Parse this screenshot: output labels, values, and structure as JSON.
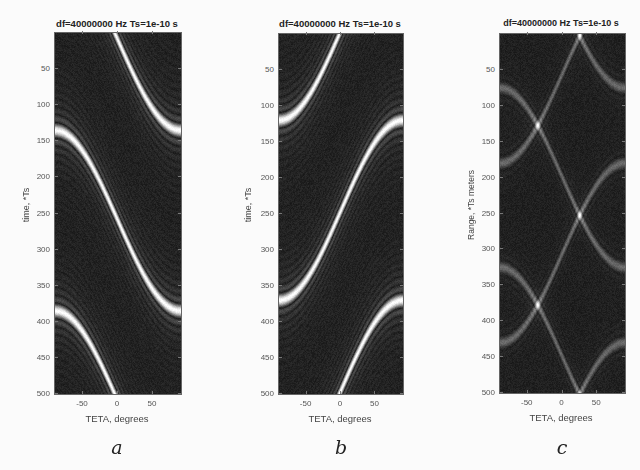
{
  "figure": {
    "panels": [
      {
        "id": "a",
        "caption": "a",
        "title": "df=40000000  Hz Ts=1e-10 s",
        "xlabel": "TETA, degrees",
        "ylabel": "time, *Ts",
        "xticks": [
          "-50",
          "0",
          "50"
        ],
        "yticks": [
          "50",
          "100",
          "150",
          "200",
          "250",
          "300",
          "350",
          "400",
          "450",
          "500"
        ]
      },
      {
        "id": "b",
        "caption": "b",
        "title": "df=40000000  Hz Ts=1e-10 s",
        "xlabel": "TETA, degrees",
        "ylabel": "time, *Ts",
        "xticks": [
          "-50",
          "0",
          "50"
        ],
        "yticks": [
          "50",
          "100",
          "150",
          "200",
          "250",
          "300",
          "350",
          "400",
          "450",
          "500"
        ]
      },
      {
        "id": "c",
        "caption": "c",
        "title": "df=40000000  Hz Ts=1e-10 s",
        "xlabel": "TETA, degrees",
        "ylabel": "Range, *Ts meters",
        "xticks": [
          "-50",
          "0",
          "50"
        ],
        "yticks": [
          "50",
          "100",
          "150",
          "200",
          "250",
          "300",
          "350",
          "400",
          "450",
          "500"
        ]
      }
    ]
  },
  "chart_data": [
    {
      "type": "heatmap",
      "panel": "a",
      "title": "df=40000000  Hz Ts=1e-10 s",
      "xlabel": "TETA, degrees",
      "ylabel": "time, *Ts",
      "xlim": [
        -90,
        90
      ],
      "ylim": [
        0,
        500
      ],
      "y_reversed": true,
      "colormap": "gray",
      "xticks": [
        -50,
        0,
        50
      ],
      "yticks": [
        50,
        100,
        150,
        200,
        250,
        300,
        350,
        400,
        450,
        500
      ],
      "pattern": "periodic bright S-shaped ridge rising left-to-right (time increases with TETA), period ~250 *Ts, ridge center at TETA=0 near t=10 and t=260, with dark interleaved sidelobes",
      "ridge": {
        "period": 250,
        "phase_at_teta0": [
          10,
          260
        ],
        "slope_direction": 1,
        "amplitude": 125
      }
    },
    {
      "type": "heatmap",
      "panel": "b",
      "title": "df=40000000  Hz Ts=1e-10 s",
      "xlabel": "TETA, degrees",
      "ylabel": "time, *Ts",
      "xlim": [
        -90,
        90
      ],
      "ylim": [
        0,
        500
      ],
      "y_reversed": true,
      "colormap": "gray",
      "xticks": [
        -50,
        0,
        50
      ],
      "yticks": [
        50,
        100,
        150,
        200,
        250,
        300,
        350,
        400,
        450,
        500
      ],
      "pattern": "periodic bright S-shaped ridge falling left-to-right (time decreases with TETA), period ~250 *Ts, ridge center at TETA=0 near t=245 and t=495, with dark interleaved sidelobes",
      "ridge": {
        "period": 250,
        "phase_at_teta0": [
          245,
          495
        ],
        "slope_direction": -1,
        "amplitude": 125
      }
    },
    {
      "type": "heatmap",
      "panel": "c",
      "title": "df=40000000  Hz Ts=1e-10 s",
      "xlabel": "TETA, degrees",
      "ylabel": "Range, *Ts meters",
      "xlim": [
        -90,
        90
      ],
      "ylim": [
        0,
        500
      ],
      "y_reversed": true,
      "colormap": "gray",
      "xticks": [
        -50,
        0,
        50
      ],
      "yticks": [
        50,
        100,
        150,
        200,
        250,
        300,
        350,
        400,
        450,
        500
      ],
      "pattern": "X-shaped lattice (product of panels a and b), bright peaks at TETA=0 near range 200 and 450, dimmer lobes at TETA≈±40 near ranges 60, 120, 310, 370",
      "peaks": [
        {
          "teta": 0,
          "range": 200,
          "intensity": 1.0
        },
        {
          "teta": 0,
          "range": 450,
          "intensity": 0.9
        },
        {
          "teta": -40,
          "range": 60,
          "intensity": 0.45
        },
        {
          "teta": 40,
          "range": 60,
          "intensity": 0.45
        },
        {
          "teta": -40,
          "range": 120,
          "intensity": 0.5
        },
        {
          "teta": 40,
          "range": 120,
          "intensity": 0.5
        },
        {
          "teta": -40,
          "range": 310,
          "intensity": 0.45
        },
        {
          "teta": 40,
          "range": 310,
          "intensity": 0.45
        },
        {
          "teta": -40,
          "range": 370,
          "intensity": 0.5
        },
        {
          "teta": 40,
          "range": 370,
          "intensity": 0.5
        }
      ]
    }
  ]
}
